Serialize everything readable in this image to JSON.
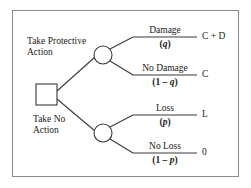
{
  "diagram": {
    "type": "decision-tree",
    "colors": {
      "border": "#8a8a8a",
      "line": "#3a3a3a",
      "text": "#1a1a1a",
      "background": "#ffffff"
    },
    "decision_node": {
      "shape": "square",
      "label": ""
    },
    "branches": [
      {
        "id": "protective",
        "action_label_line1": "Take Protective",
        "action_label_line2": "Action",
        "chance_node_shape": "circle",
        "outcomes": [
          {
            "id": "damage",
            "event": "Damage",
            "probability": "(q)",
            "probability_prefix": "(",
            "probability_symbol": "q",
            "probability_suffix": ")",
            "value": "C + D"
          },
          {
            "id": "no-damage",
            "event": "No Damage",
            "probability": "(1 – q)",
            "probability_prefix": "(1 – ",
            "probability_symbol": "q",
            "probability_suffix": ")",
            "value": "C"
          }
        ]
      },
      {
        "id": "no-action",
        "action_label_line1": "Take No",
        "action_label_line2": "Action",
        "chance_node_shape": "circle",
        "outcomes": [
          {
            "id": "loss",
            "event": "Loss",
            "probability": "(p)",
            "probability_prefix": "(",
            "probability_symbol": "p",
            "probability_suffix": ")",
            "value": "L"
          },
          {
            "id": "no-loss",
            "event": "No Loss",
            "probability": "(1 – p)",
            "probability_prefix": "(1 – ",
            "probability_symbol": "p",
            "probability_suffix": ")",
            "value": "0"
          }
        ]
      }
    ]
  }
}
